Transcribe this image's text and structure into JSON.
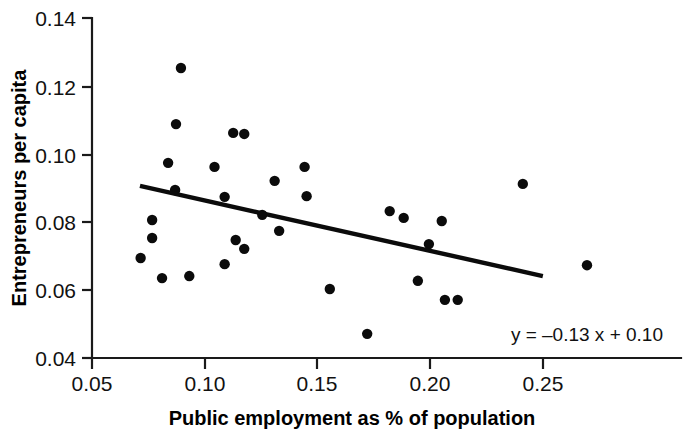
{
  "chart_data": {
    "type": "scatter",
    "title": "",
    "xlabel": "Public employment as % of population",
    "ylabel": "Entrepreneurs per capita",
    "xlim": [
      0.042,
      0.2705
    ],
    "ylim": [
      0.04,
      0.14
    ],
    "xticks": [
      0.05,
      0.1,
      0.15,
      0.2,
      0.25
    ],
    "xtick_labels": [
      "0.05",
      "0.10",
      "0.15",
      "0.20",
      "0.25"
    ],
    "yticks": [
      0.04,
      0.06,
      0.08,
      0.1,
      0.12,
      0.14
    ],
    "ytick_labels": [
      "0.04",
      "0.06",
      "0.08",
      "0.10",
      "0.12",
      "0.14"
    ],
    "grid": false,
    "legend": null,
    "annotation": "y = –0.13 x + 0.10",
    "annotation_position": "bottom-right",
    "marker": "filled-circle",
    "marker_color": "#0b0b0b",
    "line_color": "#0b0b0b",
    "points": [
      {
        "x": 0.0895,
        "y": 0.1253
      },
      {
        "x": 0.0873,
        "y": 0.1088
      },
      {
        "x": 0.0838,
        "y": 0.0974
      },
      {
        "x": 0.0869,
        "y": 0.0894
      },
      {
        "x": 0.0767,
        "y": 0.0806
      },
      {
        "x": 0.0767,
        "y": 0.0753
      },
      {
        "x": 0.0716,
        "y": 0.0694
      },
      {
        "x": 0.0811,
        "y": 0.0635
      },
      {
        "x": 0.0932,
        "y": 0.0641
      },
      {
        "x": 0.1044,
        "y": 0.0962
      },
      {
        "x": 0.1127,
        "y": 0.1062
      },
      {
        "x": 0.1176,
        "y": 0.1059
      },
      {
        "x": 0.1089,
        "y": 0.0874
      },
      {
        "x": 0.1311,
        "y": 0.0921
      },
      {
        "x": 0.1089,
        "y": 0.0676
      },
      {
        "x": 0.1138,
        "y": 0.0747
      },
      {
        "x": 0.1176,
        "y": 0.0721
      },
      {
        "x": 0.1256,
        "y": 0.0821
      },
      {
        "x": 0.1331,
        "y": 0.0774
      },
      {
        "x": 0.1444,
        "y": 0.0962
      },
      {
        "x": 0.1453,
        "y": 0.0876
      },
      {
        "x": 0.1556,
        "y": 0.0603
      },
      {
        "x": 0.1722,
        "y": 0.0471
      },
      {
        "x": 0.1822,
        "y": 0.0832
      },
      {
        "x": 0.1884,
        "y": 0.0812
      },
      {
        "x": 0.2053,
        "y": 0.0803
      },
      {
        "x": 0.2067,
        "y": 0.0571
      },
      {
        "x": 0.1947,
        "y": 0.0627
      },
      {
        "x": 0.1996,
        "y": 0.0735
      },
      {
        "x": 0.2413,
        "y": 0.0912
      },
      {
        "x": 0.2124,
        "y": 0.0571
      },
      {
        "x": 0.2698,
        "y": 0.0673
      }
    ],
    "trend_line": {
      "equation": "y = –0.13 x + 0.10",
      "slope": -0.13,
      "intercept": 0.1,
      "x_start": 0.0713,
      "x_end": 0.2502,
      "y_start": 0.0906,
      "y_end": 0.0641
    }
  }
}
